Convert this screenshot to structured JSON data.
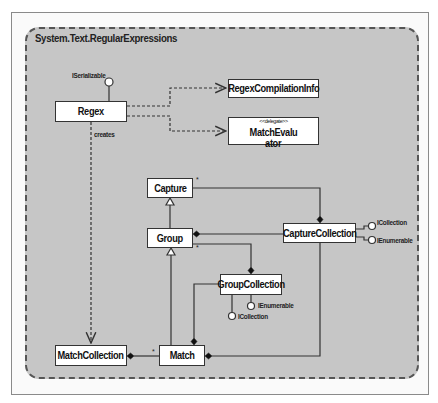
{
  "package": {
    "title": "System.Text.RegularExpressions"
  },
  "classes": {
    "regex": "Regex",
    "regex_compilation_info": "RegexCompilationInfo",
    "match_evaluator": {
      "stereotype": "<<delegate>>",
      "name_line1": "MatchEvalu",
      "name_line2": "ator"
    },
    "capture": "Capture",
    "group": "Group",
    "capture_collection": "CaptureCollection",
    "group_collection": "GroupCollection",
    "match_collection": "MatchCollection",
    "match": "Match"
  },
  "interfaces": {
    "regex_iserializable": "ISerializable",
    "capture_collection_icollection": "ICollection",
    "capture_collection_ienumerable": "IEnumerable",
    "group_collection_ienumerable": "IEnumerable",
    "group_collection_icollection": "ICollection"
  },
  "relations": {
    "creates_label": "creates",
    "multiplicity_many": "*"
  },
  "colors": {
    "package_fill": "#c6c6c6",
    "line": "#333333",
    "box_fill": "#ffffff"
  }
}
